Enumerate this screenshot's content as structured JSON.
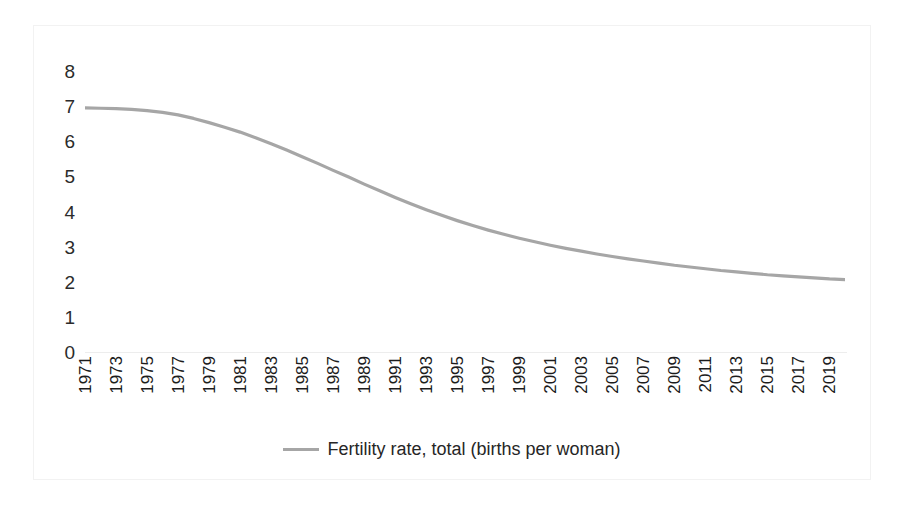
{
  "chart_data": {
    "type": "line",
    "title": "",
    "xlabel": "",
    "ylabel": "",
    "ylim": [
      0,
      8
    ],
    "yticks": [
      8,
      7,
      6,
      5,
      4,
      3,
      2,
      1,
      0
    ],
    "grid": false,
    "legend_position": "bottom",
    "line_color": "#a6a6a6",
    "categories": [
      "1971",
      "1972",
      "1973",
      "1974",
      "1975",
      "1976",
      "1977",
      "1978",
      "1979",
      "1980",
      "1981",
      "1982",
      "1983",
      "1984",
      "1985",
      "1986",
      "1987",
      "1988",
      "1989",
      "1990",
      "1991",
      "1992",
      "1993",
      "1994",
      "1995",
      "1996",
      "1997",
      "1998",
      "1999",
      "2000",
      "2001",
      "2002",
      "2003",
      "2004",
      "2005",
      "2006",
      "2007",
      "2008",
      "2009",
      "2010",
      "2011",
      "2012",
      "2013",
      "2014",
      "2015",
      "2016",
      "2017",
      "2018",
      "2019",
      "2020"
    ],
    "xtick_labels": [
      "1971",
      "1973",
      "1975",
      "1977",
      "1979",
      "1981",
      "1983",
      "1985",
      "1987",
      "1989",
      "1991",
      "1993",
      "1995",
      "1997",
      "1999",
      "2001",
      "2003",
      "2005",
      "2007",
      "2009",
      "2011",
      "2013",
      "2015",
      "2017",
      "2019"
    ],
    "series": [
      {
        "name": "Fertility rate, total (births per woman)",
        "values": [
          6.95,
          6.94,
          6.93,
          6.91,
          6.87,
          6.82,
          6.75,
          6.65,
          6.53,
          6.4,
          6.26,
          6.1,
          5.93,
          5.75,
          5.56,
          5.37,
          5.17,
          4.98,
          4.78,
          4.59,
          4.4,
          4.22,
          4.05,
          3.89,
          3.74,
          3.6,
          3.47,
          3.35,
          3.24,
          3.14,
          3.04,
          2.95,
          2.87,
          2.79,
          2.72,
          2.65,
          2.59,
          2.53,
          2.47,
          2.42,
          2.37,
          2.32,
          2.28,
          2.24,
          2.2,
          2.17,
          2.14,
          2.11,
          2.08,
          2.06
        ]
      }
    ]
  },
  "legend": {
    "swatch_name": "line-swatch",
    "label": "Fertility rate, total (births per woman)"
  }
}
